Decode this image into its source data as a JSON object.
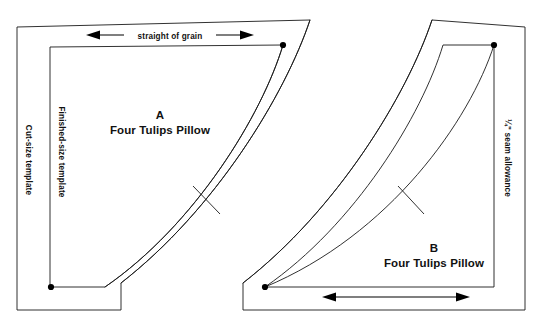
{
  "page": {
    "background_color": "#ffffff",
    "line_color": "#1a1a1a",
    "width": 545,
    "height": 329
  },
  "templates": [
    {
      "id": "a",
      "letter": "A",
      "name": "Four Tulips Pillow",
      "grain_label": "straight of grain",
      "cut_size_label": "Cut-size template",
      "finished_size_label": "Finished-size template"
    },
    {
      "id": "b",
      "letter": "B",
      "name": "Four Tulips Pillow",
      "seam_allowance_label": "¼\" seam allowance"
    }
  ],
  "markers": {
    "dot_a_top_right": "corner-dot",
    "dot_a_bottom_left": "corner-dot",
    "dot_b_top_right": "corner-dot",
    "dot_b_bottom_left": "corner-dot",
    "notch_a": "notch-mark",
    "notch_b": "notch-mark"
  },
  "arrows": {
    "grain_arrow_a": "double-headed-arrow",
    "grain_arrow_b": "double-headed-arrow"
  }
}
